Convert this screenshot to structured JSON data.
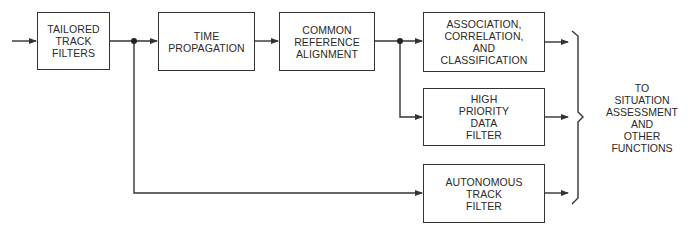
{
  "diagram": {
    "type": "block-flow-diagram",
    "colors": {
      "line": "#333333",
      "text": "#2a2a2a",
      "background": "#ffffff"
    },
    "boxes": {
      "tailored": {
        "lines": [
          "TAILORED",
          "TRACK",
          "FILTERS"
        ]
      },
      "time": {
        "lines": [
          "TIME",
          "PROPAGATION"
        ]
      },
      "common": {
        "lines": [
          "COMMON",
          "REFERENCE",
          "ALIGNMENT"
        ]
      },
      "assoc": {
        "lines": [
          "ASSOCIATION,",
          "CORRELATION,",
          "AND",
          "CLASSIFICATION"
        ]
      },
      "highpri": {
        "lines": [
          "HIGH",
          "PRIORITY",
          "DATA",
          "FILTER"
        ]
      },
      "autonomous": {
        "lines": [
          "AUTONOMOUS",
          "TRACK",
          "FILTER"
        ]
      }
    },
    "output": {
      "lines": [
        "TO",
        "SITUATION",
        "ASSESSMENT",
        "AND",
        "OTHER",
        "FUNCTIONS"
      ]
    },
    "edges": [
      {
        "from": "input",
        "to": "tailored"
      },
      {
        "from": "tailored",
        "to": "time"
      },
      {
        "from": "tailored",
        "to": "autonomous"
      },
      {
        "from": "time",
        "to": "common"
      },
      {
        "from": "common",
        "to": "assoc"
      },
      {
        "from": "common",
        "to": "highpri"
      },
      {
        "from": "assoc",
        "to": "output"
      },
      {
        "from": "highpri",
        "to": "output"
      },
      {
        "from": "autonomous",
        "to": "output"
      }
    ]
  }
}
